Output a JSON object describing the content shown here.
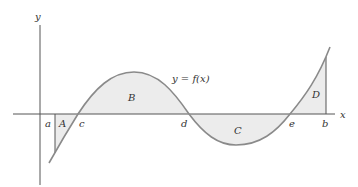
{
  "diagram": {
    "function_label": "y = f(x)",
    "axes": {
      "x_label": "x",
      "y_label": "y"
    },
    "points": {
      "a": "a",
      "c": "c",
      "d": "d",
      "e": "e",
      "b": "b"
    },
    "regions": {
      "A": "A",
      "B": "B",
      "C": "C",
      "D": "D"
    },
    "colors": {
      "curve": "#8a8a8a",
      "fill": "#ececec",
      "axis": "#555555"
    }
  }
}
